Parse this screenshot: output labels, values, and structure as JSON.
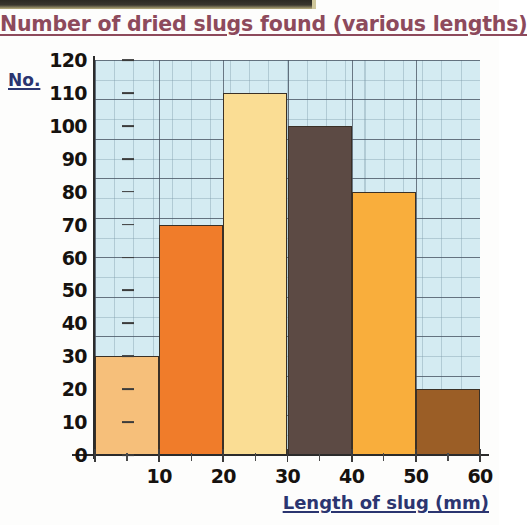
{
  "chart_data": {
    "type": "bar",
    "title": "Number of dried slugs found (various lengths)",
    "xlabel": "Length of slug (mm)",
    "ylabel": "No.",
    "categories": [
      "0-10",
      "10-20",
      "20-30",
      "30-40",
      "40-50",
      "50-60"
    ],
    "bin_edges": [
      0,
      10,
      20,
      30,
      40,
      50,
      60
    ],
    "values": [
      30,
      70,
      110,
      100,
      80,
      20
    ],
    "bar_colors": [
      "#f6bf7a",
      "#f07c2a",
      "#fadd94",
      "#5c4a44",
      "#f9ae3c",
      "#9b5e26"
    ],
    "ylim": [
      0,
      120
    ],
    "xlim": [
      0,
      60
    ],
    "y_ticks": [
      120,
      110,
      100,
      90,
      80,
      70,
      60,
      50,
      40,
      30,
      20,
      10,
      0
    ],
    "x_ticks": [
      10,
      20,
      30,
      40,
      50,
      60
    ],
    "grid": true,
    "legend": false,
    "plot_background": "#d4ebf2",
    "title_color": "#8d4a5c",
    "axis_label_color": "#2b3570"
  }
}
